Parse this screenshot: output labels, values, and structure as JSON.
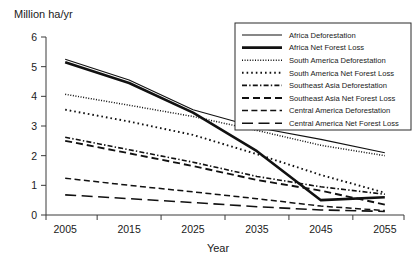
{
  "chart_data": {
    "type": "line",
    "title": "",
    "ylabel": "Million ha/yr",
    "xlabel": "Year",
    "x": [
      2005,
      2015,
      2025,
      2035,
      2045,
      2055
    ],
    "xlim": [
      2002,
      2058
    ],
    "ylim": [
      0,
      6
    ],
    "xticks": [
      2005,
      2015,
      2025,
      2035,
      2045,
      2055
    ],
    "yticks": [
      0,
      1,
      2,
      3,
      4,
      5,
      6
    ],
    "grid": false,
    "legend_position": "top-right",
    "series": [
      {
        "name": "Africa Deforestation",
        "style": "solid-thin",
        "values": [
          5.25,
          4.55,
          3.55,
          2.95,
          2.55,
          2.1
        ]
      },
      {
        "name": "Africa Net Forest Loss",
        "style": "solid-thick",
        "values": [
          5.15,
          4.45,
          3.45,
          2.15,
          0.5,
          0.6
        ]
      },
      {
        "name": "South America Deforestation",
        "style": "dotted-fine",
        "values": [
          4.07,
          3.7,
          3.32,
          2.85,
          2.35,
          2.0
        ]
      },
      {
        "name": "South America Net Forest Loss",
        "style": "dotted-coarse",
        "values": [
          3.55,
          3.15,
          2.7,
          2.05,
          1.35,
          0.75
        ]
      },
      {
        "name": "Southeast Asia Deforestation",
        "style": "dash-dot",
        "values": [
          2.62,
          2.2,
          1.78,
          1.3,
          0.95,
          0.7
        ]
      },
      {
        "name": "Southeast Asia Net Forest Loss",
        "style": "dash-medium",
        "values": [
          2.5,
          2.08,
          1.65,
          1.18,
          0.82,
          0.35
        ]
      },
      {
        "name": "Central America Deforestation",
        "style": "dash-short",
        "values": [
          1.24,
          1.0,
          0.78,
          0.55,
          0.3,
          0.15
        ]
      },
      {
        "name": "Central America Net Forest Loss",
        "style": "dash-long",
        "values": [
          0.68,
          0.55,
          0.42,
          0.28,
          0.17,
          0.12
        ]
      }
    ]
  },
  "axes": {
    "y_axis_title": "Million ha/yr",
    "x_axis_title": "Year",
    "y_tick_labels": [
      "6",
      "5",
      "4",
      "3",
      "2",
      "1",
      "0"
    ],
    "x_tick_labels": [
      "2005",
      "2015",
      "2025",
      "2035",
      "2045",
      "2055"
    ]
  },
  "legend": {
    "entries": [
      "Africa Deforestation",
      "Africa Net Forest Loss",
      "South America Deforestation",
      "South America Net Forest Loss",
      "Southeast Asia Deforestation",
      "Southeast Asia Net Forest Loss",
      "Central America Deforestation",
      "Central America Net Forest Loss"
    ]
  },
  "colors": {
    "line": "#111111",
    "axis": "#3a3a3a",
    "text": "#1a1a1a",
    "background": "#ffffff"
  }
}
